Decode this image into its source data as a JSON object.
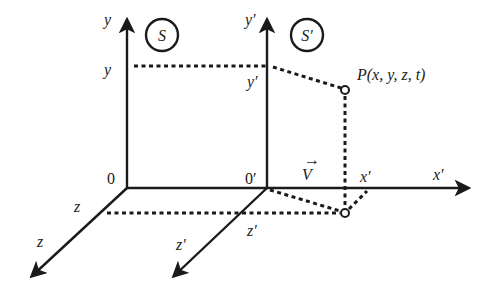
{
  "diagram": {
    "frame_s": {
      "badge": "S",
      "origin_label": "0",
      "y_axis_label": "y",
      "y_projection_label": "y",
      "z_axis_label": "z",
      "z_projection_label": "z"
    },
    "frame_s_prime": {
      "badge": "S′",
      "origin_label": "0′",
      "y_axis_label": "y′",
      "y_projection_label": "y′",
      "x_axis_label": "x′",
      "x_projection_label": "x′",
      "z_axis_label": "z′",
      "z_projection_label": "z′"
    },
    "velocity_label": "V",
    "velocity_arrow": "→",
    "point_label": "P(x, y, z, t)",
    "colors": {
      "ink": "#1a1a1a",
      "background": "#ffffff"
    }
  }
}
